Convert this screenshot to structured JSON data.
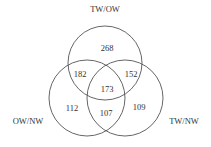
{
  "diagram": {
    "type": "venn-3",
    "sets": [
      {
        "id": "top",
        "label": "TW/OW"
      },
      {
        "id": "left",
        "label": "OW/NW"
      },
      {
        "id": "right",
        "label": "TW/NW"
      }
    ],
    "regions": {
      "top_only": "268",
      "left_only": "112",
      "right_only": "109",
      "top_left": "182",
      "top_right": "152",
      "left_right": "107",
      "all_three": "173"
    },
    "colors": {
      "stroke": "#555555",
      "text": "#333333",
      "background": "#ffffff"
    }
  }
}
